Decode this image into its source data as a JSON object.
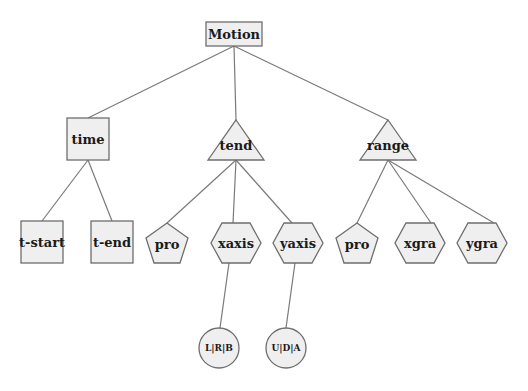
{
  "diagram": {
    "type": "tree",
    "root": "Motion",
    "colors": {
      "fill": "#efefef",
      "stroke": "#6e6e6e",
      "edge": "#7a7a7a",
      "text": "#1a1a1a"
    },
    "nodes": {
      "motion": {
        "label": "Motion",
        "shape": "rectangle"
      },
      "time": {
        "label": "time",
        "shape": "square"
      },
      "tend": {
        "label": "tend",
        "shape": "triangle"
      },
      "range": {
        "label": "range",
        "shape": "triangle"
      },
      "tstart": {
        "label": "t-start",
        "shape": "square"
      },
      "tend2": {
        "label": "t-end",
        "shape": "square"
      },
      "pro1": {
        "label": "pro",
        "shape": "pentagon"
      },
      "xaxis": {
        "label": "xaxis",
        "shape": "hexagon"
      },
      "yaxis": {
        "label": "yaxis",
        "shape": "hexagon"
      },
      "pro2": {
        "label": "pro",
        "shape": "pentagon"
      },
      "xgra": {
        "label": "xgra",
        "shape": "hexagon"
      },
      "ygra": {
        "label": "ygra",
        "shape": "hexagon"
      },
      "lrb": {
        "label": "L|R|B",
        "shape": "circle"
      },
      "uda": {
        "label": "U|D|A",
        "shape": "circle"
      }
    },
    "edges": [
      [
        "Motion",
        "time"
      ],
      [
        "Motion",
        "tend"
      ],
      [
        "Motion",
        "range"
      ],
      [
        "time",
        "t-start"
      ],
      [
        "time",
        "t-end"
      ],
      [
        "tend",
        "pro"
      ],
      [
        "tend",
        "xaxis"
      ],
      [
        "tend",
        "yaxis"
      ],
      [
        "range",
        "pro"
      ],
      [
        "range",
        "xgra"
      ],
      [
        "range",
        "ygra"
      ],
      [
        "xaxis",
        "L|R|B"
      ],
      [
        "yaxis",
        "U|D|A"
      ]
    ]
  }
}
